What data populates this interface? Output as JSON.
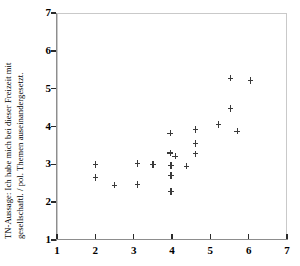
{
  "chart_data": {
    "type": "scatter",
    "title": "",
    "xlabel": "",
    "ylabel_line1": "TN-Aussage: Ich habe mich bei dieser Freizeit mit",
    "ylabel_line2": "gesellschaftl. / pol. Themen auseinandergesetzt.",
    "xlim": [
      1,
      7
    ],
    "ylim": [
      1,
      7
    ],
    "xticks": [
      1,
      2,
      3,
      4,
      5,
      6,
      7
    ],
    "yticks": [
      1,
      2,
      3,
      4,
      5,
      6,
      7
    ],
    "xticklabels": [
      "1",
      "2",
      "3",
      "4",
      "5",
      "6",
      "7"
    ],
    "yticklabels": [
      "1",
      "2",
      "3",
      "4",
      "5",
      "6",
      "7"
    ],
    "grid": false,
    "legend": null,
    "marker": "plus",
    "marker_color": "#3a3a3a",
    "points": [
      {
        "x": 2.0,
        "y": 3.0
      },
      {
        "x": 2.0,
        "y": 2.65
      },
      {
        "x": 2.5,
        "y": 2.45
      },
      {
        "x": 3.1,
        "y": 3.02
      },
      {
        "x": 3.1,
        "y": 2.47
      },
      {
        "x": 3.5,
        "y": 3.0
      },
      {
        "x": 3.95,
        "y": 3.82
      },
      {
        "x": 3.95,
        "y": 3.3
      },
      {
        "x": 4.08,
        "y": 3.22
      },
      {
        "x": 3.97,
        "y": 2.97
      },
      {
        "x": 3.97,
        "y": 2.7
      },
      {
        "x": 3.97,
        "y": 2.28
      },
      {
        "x": 4.38,
        "y": 2.95
      },
      {
        "x": 4.62,
        "y": 3.92
      },
      {
        "x": 4.62,
        "y": 3.55
      },
      {
        "x": 4.62,
        "y": 3.28
      },
      {
        "x": 5.22,
        "y": 4.05
      },
      {
        "x": 5.52,
        "y": 4.48
      },
      {
        "x": 5.52,
        "y": 5.28
      },
      {
        "x": 5.7,
        "y": 3.88
      },
      {
        "x": 6.05,
        "y": 5.22
      }
    ]
  }
}
